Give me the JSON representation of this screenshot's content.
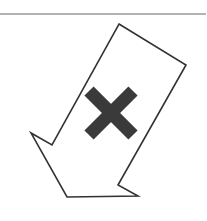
{
  "figure": {
    "colors": {
      "background": "#ffffff",
      "rule": "#9a9a9a",
      "arrow_outline": "#333333",
      "arrow_fill": "#ffffff",
      "x_mark": "#3a3a3a"
    },
    "rule": {
      "y": 14,
      "x1": 0,
      "x2": 206
    },
    "arrow_points": "119,24 186,65 118,185 138,196 67,197 31,133 52,145",
    "x_mark": {
      "cx": 111,
      "cy": 113,
      "half": 22,
      "stroke_width": 13
    }
  }
}
